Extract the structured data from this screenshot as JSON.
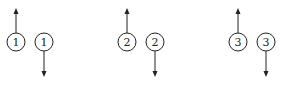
{
  "diagram": {
    "background": "#ffffff",
    "stroke_color": "#222222",
    "circle_radius": 9,
    "pairs": [
      {
        "id": 1,
        "left": {
          "label": "1",
          "cx": 16,
          "cy": 42,
          "arrow": "up"
        },
        "right": {
          "label": "1",
          "cx": 44,
          "cy": 42,
          "arrow": "down"
        }
      },
      {
        "id": 2,
        "left": {
          "label": "2",
          "cx": 127,
          "cy": 42,
          "arrow": "up"
        },
        "right": {
          "label": "2",
          "cx": 155,
          "cy": 42,
          "arrow": "down"
        }
      },
      {
        "id": 3,
        "left": {
          "label": "3",
          "cx": 238,
          "cy": 42,
          "arrow": "up"
        },
        "right": {
          "label": "3",
          "cx": 266,
          "cy": 42,
          "arrow": "down"
        }
      }
    ],
    "arrow": {
      "up_tip_y": 8,
      "down_tip_y": 77
    }
  }
}
